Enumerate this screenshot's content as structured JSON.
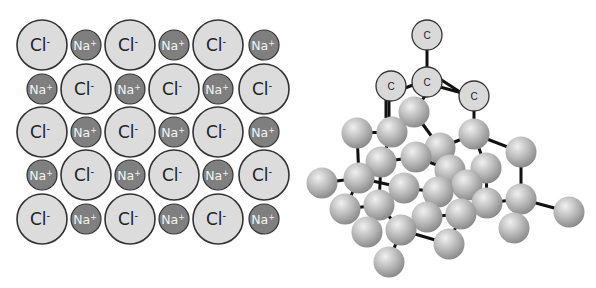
{
  "nacl": {
    "title": "Sodium chloride ionic lattice",
    "cl_label": "Cl",
    "cl_charge": "-",
    "na_label": "Na",
    "na_charge": "+",
    "colors": {
      "cl_fill": "#dcdcdc",
      "na_fill": "#7f7f7f",
      "stroke": "#333333",
      "cl_text": "#222222",
      "na_text": "#f2f2f2"
    },
    "cl_radius": 25,
    "na_radius": 15,
    "columns_x": [
      42,
      86,
      130,
      174,
      218,
      264
    ],
    "rows_y": [
      45,
      89,
      132,
      175,
      219
    ],
    "rows": [
      [
        "Cl",
        "Na",
        "Cl",
        "Na",
        "Cl",
        "Na"
      ],
      [
        "Na",
        "Cl",
        "Na",
        "Cl",
        "Na",
        "Cl"
      ],
      [
        "Cl",
        "Na",
        "Cl",
        "Na",
        "Cl",
        "Na"
      ],
      [
        "Na",
        "Cl",
        "Na",
        "Cl",
        "Na",
        "Cl"
      ],
      [
        "Cl",
        "Na",
        "Cl",
        "Na",
        "Cl",
        "Na"
      ]
    ]
  },
  "diamond": {
    "title": "Diamond carbon lattice",
    "atom_label": "C",
    "colors": {
      "labeled_fill": "#d9d9d9",
      "sphere_light": "#e6e6e6",
      "sphere_dark": "#8a8a8a",
      "bond": "#111111"
    },
    "labeled_atoms": [
      {
        "x": 427,
        "y": 35
      },
      {
        "x": 391,
        "y": 86
      },
      {
        "x": 427,
        "y": 82
      },
      {
        "x": 474,
        "y": 96
      }
    ],
    "spheres": [
      {
        "x": 414,
        "y": 112
      },
      {
        "x": 357,
        "y": 133
      },
      {
        "x": 392,
        "y": 132
      },
      {
        "x": 440,
        "y": 148
      },
      {
        "x": 474,
        "y": 134
      },
      {
        "x": 381,
        "y": 162
      },
      {
        "x": 416,
        "y": 157
      },
      {
        "x": 450,
        "y": 170
      },
      {
        "x": 521,
        "y": 152
      },
      {
        "x": 486,
        "y": 168
      },
      {
        "x": 322,
        "y": 183
      },
      {
        "x": 359,
        "y": 178
      },
      {
        "x": 345,
        "y": 209
      },
      {
        "x": 404,
        "y": 188
      },
      {
        "x": 379,
        "y": 205
      },
      {
        "x": 438,
        "y": 192
      },
      {
        "x": 467,
        "y": 185
      },
      {
        "x": 521,
        "y": 199
      },
      {
        "x": 569,
        "y": 212
      },
      {
        "x": 427,
        "y": 217
      },
      {
        "x": 461,
        "y": 214
      },
      {
        "x": 487,
        "y": 203
      },
      {
        "x": 367,
        "y": 232
      },
      {
        "x": 401,
        "y": 230
      },
      {
        "x": 449,
        "y": 244
      },
      {
        "x": 389,
        "y": 262
      },
      {
        "x": 514,
        "y": 228
      }
    ],
    "bonds": [
      [
        427,
        50,
        427,
        68
      ],
      [
        405,
        88,
        413,
        85
      ],
      [
        440,
        87,
        462,
        93
      ],
      [
        440,
        79,
        460,
        92
      ],
      [
        389,
        100,
        389,
        118
      ],
      [
        386,
        100,
        386,
        118
      ],
      [
        474,
        110,
        474,
        124
      ],
      [
        425,
        96,
        417,
        108
      ],
      [
        357,
        133,
        392,
        132
      ],
      [
        392,
        132,
        414,
        112
      ],
      [
        414,
        112,
        440,
        148
      ],
      [
        440,
        148,
        474,
        134
      ],
      [
        392,
        132,
        381,
        162
      ],
      [
        381,
        162,
        416,
        157
      ],
      [
        416,
        157,
        440,
        148
      ],
      [
        416,
        157,
        450,
        170
      ],
      [
        474,
        134,
        521,
        152
      ],
      [
        474,
        134,
        486,
        168
      ],
      [
        521,
        152,
        521,
        199
      ],
      [
        357,
        133,
        359,
        178
      ],
      [
        322,
        183,
        359,
        178
      ],
      [
        359,
        178,
        345,
        209
      ],
      [
        359,
        178,
        404,
        188
      ],
      [
        381,
        162,
        379,
        205
      ],
      [
        404,
        188,
        438,
        192
      ],
      [
        438,
        192,
        450,
        170
      ],
      [
        438,
        192,
        427,
        217
      ],
      [
        450,
        170,
        467,
        185
      ],
      [
        467,
        185,
        486,
        168
      ],
      [
        467,
        185,
        461,
        214
      ],
      [
        486,
        168,
        487,
        203
      ],
      [
        487,
        203,
        521,
        199
      ],
      [
        521,
        199,
        569,
        212
      ],
      [
        521,
        199,
        514,
        228
      ],
      [
        345,
        209,
        379,
        205
      ],
      [
        379,
        205,
        367,
        232
      ],
      [
        379,
        205,
        401,
        230
      ],
      [
        401,
        230,
        427,
        217
      ],
      [
        427,
        217,
        461,
        214
      ],
      [
        401,
        230,
        389,
        262
      ],
      [
        401,
        230,
        449,
        244
      ],
      [
        461,
        214,
        449,
        244
      ],
      [
        487,
        203,
        461,
        214
      ]
    ]
  }
}
